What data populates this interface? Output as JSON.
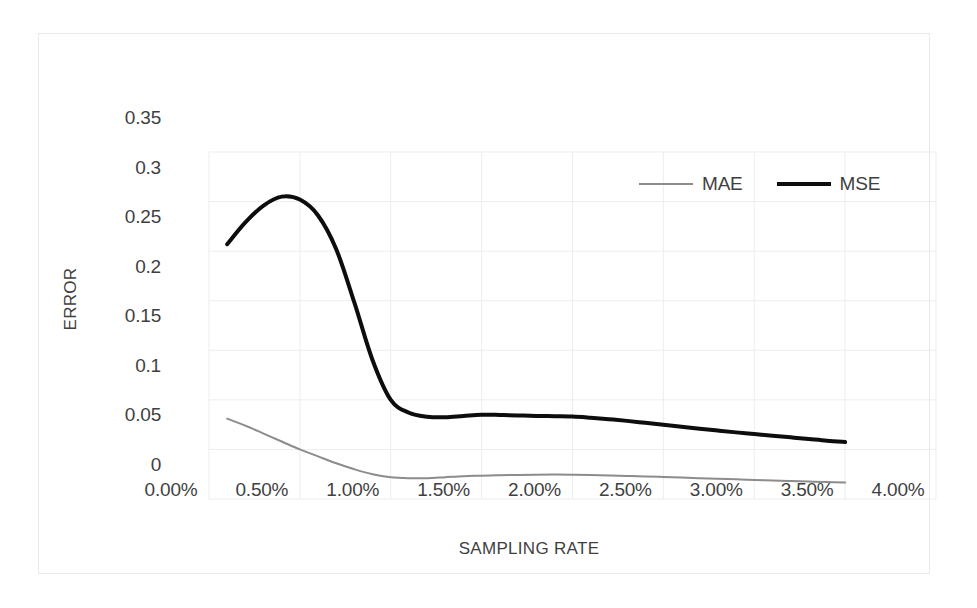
{
  "chart_data": {
    "type": "line",
    "title": "",
    "xlabel": "SAMPLING RATE",
    "ylabel": "ERROR",
    "xlim": [
      0,
      4
    ],
    "ylim": [
      0,
      0.35
    ],
    "grid": true,
    "legend_position": "top-right",
    "x_tick_labels": [
      "0.00%",
      "0.50%",
      "1.00%",
      "1.50%",
      "2.00%",
      "2.50%",
      "3.00%",
      "3.50%",
      "4.00%"
    ],
    "x_tick_values": [
      0,
      0.5,
      1,
      1.5,
      2,
      2.5,
      3,
      3.5,
      4
    ],
    "y_tick_labels": [
      "0.35",
      "0.3",
      "0.25",
      "0.2",
      "0.15",
      "0.1",
      "0.05",
      "0"
    ],
    "y_tick_values": [
      0.35,
      0.3,
      0.25,
      0.2,
      0.15,
      0.1,
      0.05,
      0
    ],
    "x": [
      0.1,
      0.2,
      0.3,
      0.4,
      0.5,
      0.6,
      0.7,
      0.8,
      0.9,
      1.0,
      1.1,
      1.2,
      1.3,
      1.4,
      1.5,
      1.6,
      1.7,
      1.8,
      1.9,
      2.0,
      2.1,
      2.2,
      2.3,
      2.4,
      2.5,
      2.6,
      2.7,
      2.8,
      2.9,
      3.0,
      3.1,
      3.2,
      3.3,
      3.4,
      3.5
    ],
    "series": [
      {
        "name": "MAE",
        "color": "#8c8c8c",
        "width": 2,
        "values": [
          0.081,
          0.074,
          0.066,
          0.058,
          0.05,
          0.043,
          0.036,
          0.03,
          0.025,
          0.022,
          0.021,
          0.021,
          0.022,
          0.023,
          0.0235,
          0.024,
          0.0243,
          0.0245,
          0.0246,
          0.0245,
          0.0242,
          0.0238,
          0.0233,
          0.0228,
          0.0222,
          0.0216,
          0.021,
          0.0204,
          0.0198,
          0.0192,
          0.0187,
          0.0181,
          0.0176,
          0.0171,
          0.0167
        ]
      },
      {
        "name": "MSE",
        "color": "#0d0d0d",
        "width": 4,
        "values": [
          0.257,
          0.279,
          0.296,
          0.305,
          0.302,
          0.286,
          0.252,
          0.198,
          0.14,
          0.1,
          0.087,
          0.083,
          0.0825,
          0.0838,
          0.085,
          0.0848,
          0.0843,
          0.0838,
          0.0835,
          0.0832,
          0.082,
          0.0805,
          0.0788,
          0.0768,
          0.0748,
          0.0728,
          0.0708,
          0.069,
          0.0672,
          0.0655,
          0.0638,
          0.0622,
          0.0605,
          0.0588,
          0.0575
        ]
      }
    ]
  },
  "legend": {
    "entries": [
      {
        "label": "MAE"
      },
      {
        "label": "MSE"
      }
    ]
  },
  "style": {
    "grid_color": "#ededed",
    "border_color": "#e9e9e9",
    "background": "#ffffff",
    "text_color": "#3f3f3f"
  }
}
